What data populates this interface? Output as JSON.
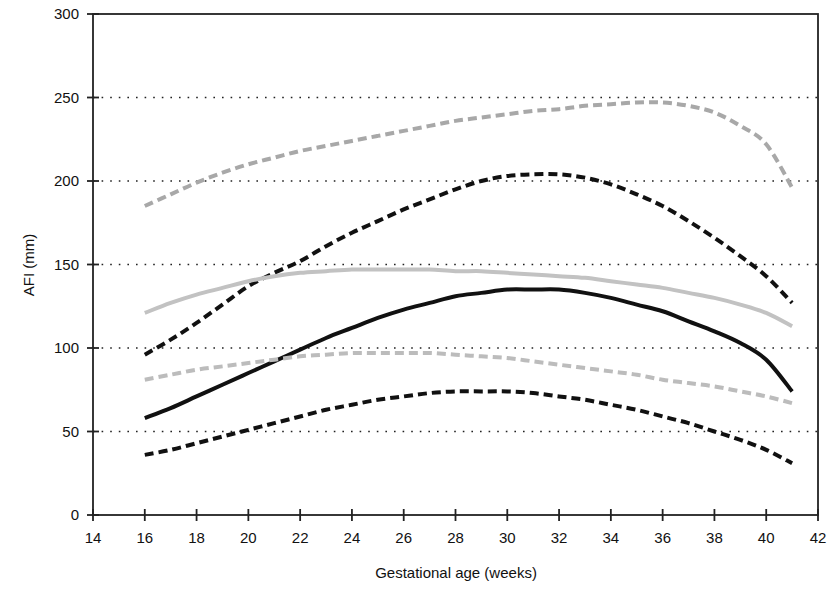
{
  "chart_data": {
    "type": "line",
    "title": "",
    "xlabel": "Gestational age (weeks)",
    "ylabel": "AFI (mm)",
    "xlim": [
      14,
      42
    ],
    "ylim": [
      0,
      300
    ],
    "xticks": [
      14,
      16,
      18,
      20,
      22,
      24,
      26,
      28,
      30,
      32,
      34,
      36,
      38,
      40,
      42
    ],
    "yticks": [
      0,
      50,
      100,
      150,
      200,
      250,
      300
    ],
    "grid": "horizontal-dotted",
    "legend": "none",
    "x": [
      16,
      17,
      18,
      19,
      20,
      21,
      22,
      23,
      24,
      25,
      26,
      27,
      28,
      29,
      30,
      31,
      32,
      33,
      34,
      35,
      36,
      37,
      38,
      39,
      40,
      41
    ],
    "series": [
      {
        "name": "upper-gray-dashed",
        "style": "dashed",
        "color": "#a8a8a8",
        "width": 4,
        "values": [
          185,
          192,
          199,
          205,
          210,
          214,
          218,
          221,
          224,
          227,
          230,
          233,
          236,
          238,
          240,
          242,
          243,
          245,
          246,
          247,
          247,
          245,
          241,
          233,
          222,
          196
        ]
      },
      {
        "name": "upper-black-dashed",
        "style": "dashed",
        "color": "#111111",
        "width": 4,
        "values": [
          96,
          105,
          115,
          126,
          137,
          145,
          152,
          161,
          169,
          176,
          183,
          189,
          195,
          200,
          203,
          204,
          204,
          202,
          198,
          192,
          185,
          176,
          166,
          155,
          143,
          127
        ]
      },
      {
        "name": "mean-gray-solid",
        "style": "solid",
        "color": "#c2c2c2",
        "width": 4,
        "values": [
          121,
          127,
          132,
          136,
          140,
          143,
          145,
          146,
          147,
          147,
          147,
          147,
          146,
          146,
          145,
          144,
          143,
          142,
          140,
          138,
          136,
          133,
          130,
          126,
          121,
          113
        ]
      },
      {
        "name": "mean-black-solid",
        "style": "solid",
        "color": "#111111",
        "width": 4,
        "values": [
          58,
          64,
          71,
          78,
          85,
          92,
          99,
          106,
          112,
          118,
          123,
          127,
          131,
          133,
          135,
          135,
          135,
          133,
          130,
          126,
          122,
          116,
          110,
          103,
          93,
          74
        ]
      },
      {
        "name": "lower-gray-dashed",
        "style": "dashed",
        "color": "#bcbcbc",
        "width": 4,
        "values": [
          81,
          84,
          87,
          89,
          91,
          93,
          95,
          96,
          97,
          97,
          97,
          97,
          96,
          95,
          94,
          92,
          90,
          88,
          86,
          84,
          81,
          79,
          77,
          74,
          71,
          67
        ]
      },
      {
        "name": "lower-black-dashed",
        "style": "dashed",
        "color": "#111111",
        "width": 4,
        "values": [
          36,
          39,
          43,
          47,
          51,
          55,
          59,
          63,
          66,
          69,
          71,
          73,
          74,
          74,
          74,
          73,
          71,
          69,
          66,
          63,
          59,
          55,
          50,
          45,
          39,
          31
        ]
      }
    ]
  }
}
